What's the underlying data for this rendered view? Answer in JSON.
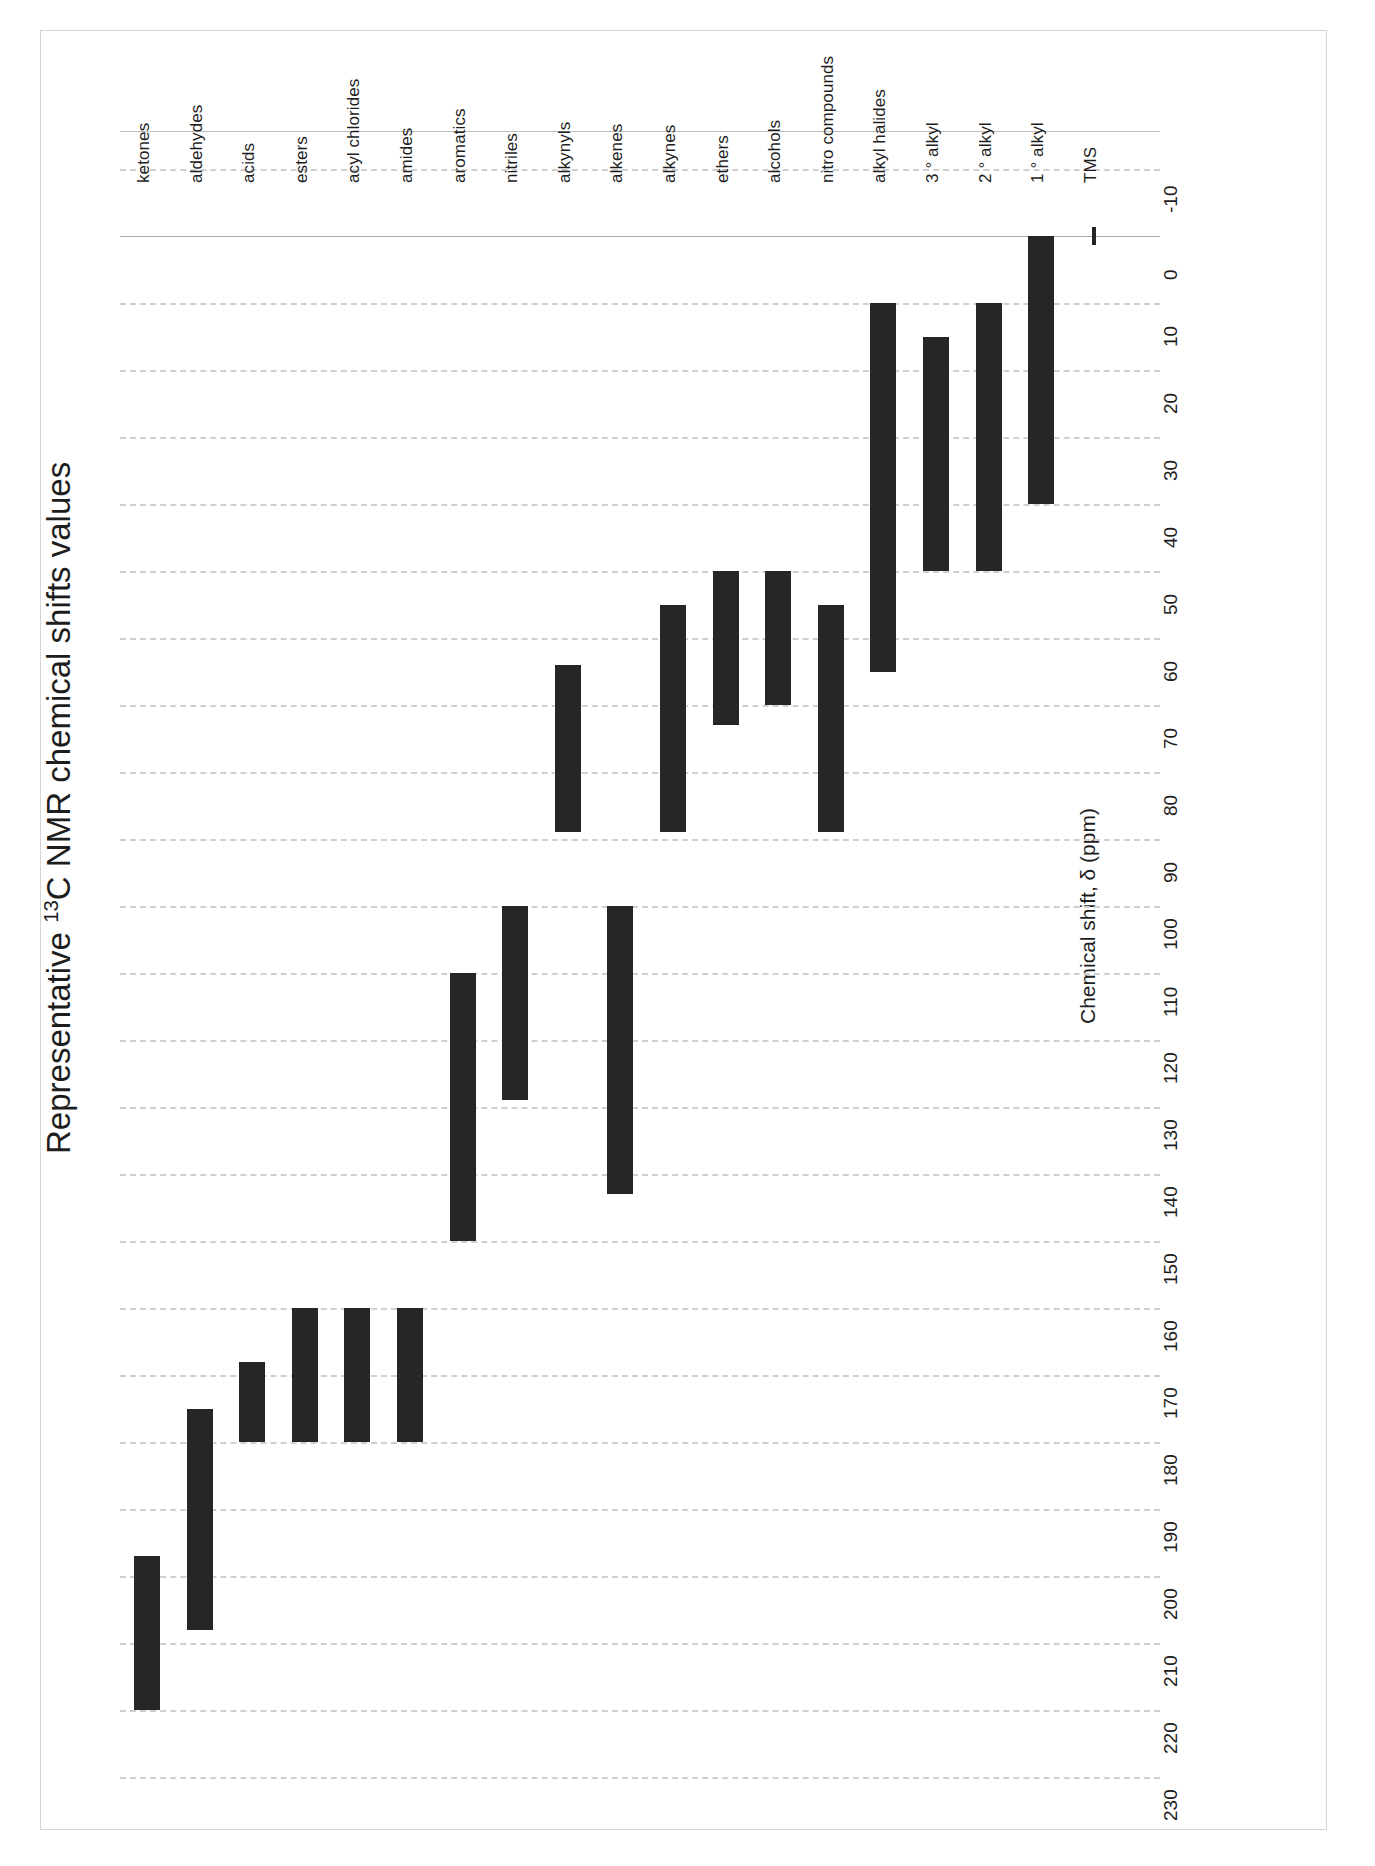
{
  "chart_data": {
    "type": "bar",
    "orientation": "horizontal-ranges-rotated",
    "title": "Representative 13C NMR chemical shifts values",
    "title_prefix": "Representative ",
    "title_sup": "13",
    "title_suffix": "C NMR chemical shifts values",
    "xlabel": "",
    "ylabel": "Chemical shift, δ (ppm)",
    "value_axis_label": "Chemical shift, δ (ppm)",
    "ylim": [
      -10,
      230
    ],
    "axis_direction": "reversed (values increase downward)",
    "tick_labels": [
      "-10",
      "0",
      "10",
      "20",
      "30",
      "40",
      "50",
      "60",
      "70",
      "80",
      "90",
      "100",
      "110",
      "120",
      "130",
      "140",
      "150",
      "160",
      "170",
      "180",
      "190",
      "200",
      "210",
      "220",
      "230"
    ],
    "tick_values": [
      -10,
      0,
      10,
      20,
      30,
      40,
      50,
      60,
      70,
      80,
      90,
      100,
      110,
      120,
      130,
      140,
      150,
      160,
      170,
      180,
      190,
      200,
      210,
      220,
      230
    ],
    "grid": true,
    "grid_style": "dashed",
    "legend": "none",
    "bar_color": "#262626",
    "grid_color": "#cfcfcf",
    "categories": [
      "ketones",
      "aldehydes",
      "acids",
      "esters",
      "acyl chlorides",
      "amides",
      "aromatics",
      "nitriles",
      "alkynyls",
      "alkenes",
      "alkynes",
      "ethers",
      "alcohols",
      "nitro compounds",
      "alkyl halides",
      "3 ° alkyl",
      "2 ° alkyl",
      "1 ° alkyl",
      "TMS"
    ],
    "ranges": [
      {
        "category": "ketones",
        "low": 197,
        "high": 220
      },
      {
        "category": "aldehydes",
        "low": 175,
        "high": 208
      },
      {
        "category": "acids",
        "low": 168,
        "high": 180
      },
      {
        "category": "esters",
        "low": 160,
        "high": 180
      },
      {
        "category": "acyl chlorides",
        "low": 160,
        "high": 180
      },
      {
        "category": "amides",
        "low": 160,
        "high": 180
      },
      {
        "category": "aromatics",
        "low": 110,
        "high": 150
      },
      {
        "category": "nitriles",
        "low": 100,
        "high": 129
      },
      {
        "category": "alkynyls",
        "low": 64,
        "high": 89
      },
      {
        "category": "alkenes",
        "low": 100,
        "high": 143
      },
      {
        "category": "alkynes",
        "low": 55,
        "high": 89
      },
      {
        "category": "ethers",
        "low": 50,
        "high": 73
      },
      {
        "category": "alcohols",
        "low": 50,
        "high": 70
      },
      {
        "category": "nitro compounds",
        "low": 55,
        "high": 89
      },
      {
        "category": "alkyl halides",
        "low": 10,
        "high": 65
      },
      {
        "category": "3 ° alkyl",
        "low": 15,
        "high": 50
      },
      {
        "category": "2 ° alkyl",
        "low": 10,
        "high": 50
      },
      {
        "category": "1 ° alkyl",
        "low": 0,
        "high": 40
      },
      {
        "category": "TMS",
        "low": 0,
        "high": 1
      }
    ],
    "units": "ppm"
  }
}
